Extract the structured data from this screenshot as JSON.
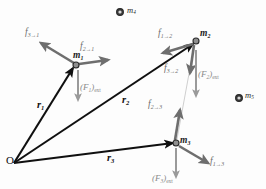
{
  "figure": {
    "type": "free-body-diagram",
    "background_color": "#fdfdfd",
    "colors": {
      "position_vector": "#101010",
      "internal_force": "#6e6e6e",
      "external_force": "#9a9a9a",
      "mass_dot": "#3c3c3c",
      "connector_line": "#c9c9c9"
    }
  },
  "origin": {
    "label": "O",
    "x": 14,
    "y": 163
  },
  "masses": [
    {
      "name": "m1",
      "base": "m",
      "sub": "1",
      "x": 76,
      "y": 65,
      "radius": 3.0,
      "in_system": true
    },
    {
      "name": "m2",
      "base": "m",
      "sub": "2",
      "x": 196,
      "y": 41,
      "radius": 3.0,
      "in_system": true
    },
    {
      "name": "m3",
      "base": "m",
      "sub": "3",
      "x": 176,
      "y": 143,
      "radius": 3.0,
      "in_system": true
    },
    {
      "name": "m4",
      "base": "m",
      "sub": "4",
      "x": 120,
      "y": 12,
      "radius": 3.4,
      "in_system": false
    },
    {
      "name": "m5",
      "base": "m",
      "sub": "5",
      "x": 239,
      "y": 98,
      "radius": 3.4,
      "in_system": false
    }
  ],
  "mass_labels": [
    {
      "name": "m1",
      "base": "m",
      "sub": "1",
      "left": 73,
      "top": 51
    },
    {
      "name": "m2",
      "base": "m",
      "sub": "2",
      "left": 200,
      "top": 29
    },
    {
      "name": "m3",
      "base": "m",
      "sub": "3",
      "left": 180,
      "top": 136
    },
    {
      "name": "m4",
      "base": "m",
      "sub": "4",
      "left": 127,
      "top": 6
    },
    {
      "name": "m5",
      "base": "m",
      "sub": "5",
      "left": 245,
      "top": 91
    }
  ],
  "position_vectors": [
    {
      "name": "r1",
      "base": "r",
      "sub": "1",
      "from_x": 14,
      "from_y": 163,
      "to_x": 73,
      "to_y": 68,
      "label_left": 37,
      "label_top": 100
    },
    {
      "name": "r2",
      "base": "r",
      "sub": "2",
      "from_x": 14,
      "from_y": 163,
      "to_x": 193,
      "to_y": 44,
      "label_left": 122,
      "label_top": 95
    },
    {
      "name": "r3",
      "base": "r",
      "sub": "3",
      "from_x": 14,
      "from_y": 163,
      "to_x": 173,
      "to_y": 143,
      "label_left": 107,
      "label_top": 153
    }
  ],
  "internal_forces": [
    {
      "name": "f3-to-1",
      "base": "f",
      "sub": "3→1",
      "from_x": 74,
      "from_y": 63,
      "to_x": 41,
      "to_y": 43,
      "label_left": 25,
      "label_top": 28
    },
    {
      "name": "f2-to-1",
      "base": "f",
      "sub": "2→1",
      "from_x": 79,
      "from_y": 64,
      "to_x": 108,
      "to_y": 60,
      "label_left": 80,
      "label_top": 42
    },
    {
      "name": "f1-to-2",
      "base": "f",
      "sub": "1→2",
      "from_x": 193,
      "from_y": 44,
      "to_x": 163,
      "to_y": 53,
      "label_left": 158,
      "label_top": 29
    },
    {
      "name": "f3-to-2",
      "base": "f",
      "sub": "3→2",
      "from_x": 194,
      "from_y": 45,
      "to_x": 190,
      "to_y": 73,
      "label_left": 164,
      "label_top": 64
    },
    {
      "name": "f2-to-3",
      "base": "f",
      "sub": "2→3",
      "from_x": 175,
      "from_y": 140,
      "to_x": 180,
      "to_y": 110,
      "label_left": 148,
      "label_top": 100
    },
    {
      "name": "f1-to-3",
      "base": "f",
      "sub": "1→3",
      "from_x": 179,
      "from_y": 146,
      "to_x": 208,
      "to_y": 163,
      "label_left": 210,
      "label_top": 157
    }
  ],
  "external_forces": [
    {
      "name": "F1-ext",
      "base": "F",
      "sub": "1",
      "suffix": "ext",
      "from_x": 78,
      "from_y": 70,
      "to_x": 78,
      "to_y": 100,
      "label_left": 80,
      "label_top": 83
    },
    {
      "name": "F2-ext",
      "base": "F",
      "sub": "2",
      "suffix": "ext",
      "from_x": 196,
      "from_y": 50,
      "to_x": 196,
      "to_y": 96,
      "label_left": 198,
      "label_top": 70
    },
    {
      "name": "F3-ext",
      "base": "F",
      "sub": "3",
      "suffix": "ext",
      "from_x": 176,
      "from_y": 148,
      "to_x": 176,
      "to_y": 177,
      "label_left": 152,
      "label_top": 174
    }
  ],
  "connector": {
    "name": "m2-m3-connector",
    "from_x": 193,
    "from_y": 52,
    "to_x": 177,
    "to_y": 139
  }
}
